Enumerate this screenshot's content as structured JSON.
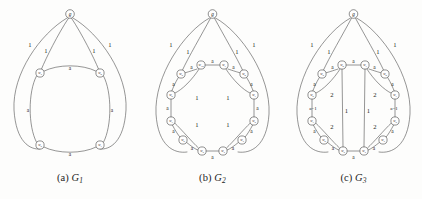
{
  "figure": {
    "background_color": "#fdfdfc",
    "stroke_color": "#555555",
    "text_color": "#1d1d1d"
  },
  "panels": [
    {
      "id": "a",
      "caption_prefix": "(a)",
      "caption_name": "G",
      "caption_sub": "1",
      "apex_label": "g",
      "apex_weights": [
        "1",
        "1",
        "1",
        "1"
      ],
      "cycle_nodes": [
        "w3",
        "w0",
        "w1",
        "w2"
      ],
      "cycle_weights": [
        "a",
        "a",
        "a",
        "a"
      ]
    },
    {
      "id": "b",
      "caption_prefix": "(b)",
      "caption_name": "G",
      "caption_sub": "2",
      "apex_label": "g",
      "apex_weights": [
        "1",
        "1",
        "1",
        "1"
      ],
      "cycle_nodes": [
        "w10",
        "w1",
        "w9",
        "w1b",
        "w2",
        "w3",
        "w4",
        "w5",
        "w6",
        "w7",
        "w8",
        "w9b"
      ],
      "cycle_weights": [
        "a",
        "a",
        "a",
        "a",
        "a",
        "a",
        "a",
        "a",
        "a",
        "a",
        "a",
        "a"
      ],
      "chord_weights": [
        "1",
        "1",
        "1",
        "1"
      ]
    },
    {
      "id": "c",
      "caption_prefix": "(c)",
      "caption_name": "G",
      "caption_sub": "3",
      "apex_label": "g",
      "apex_weights": [
        "1",
        "1",
        "1",
        "1"
      ],
      "cycle_weights": [
        "a",
        "a",
        "a",
        "a",
        "a",
        "a",
        "a",
        "a"
      ],
      "chord_weights": [
        "2",
        "2",
        "2",
        "2"
      ],
      "vertical_weights": [
        "1",
        "1"
      ],
      "long_weights": [
        "a−1",
        "a−1"
      ]
    }
  ],
  "graph_a": {
    "nodes": [
      {
        "name": "g",
        "base": "g",
        "sub": "",
        "x": 70.0,
        "y": 14.0,
        "r": 4.3
      },
      {
        "name": "w3",
        "base": "w",
        "sub": "3",
        "x": 40.0,
        "y": 73.0,
        "r": 4.1
      },
      {
        "name": "w0",
        "base": "w",
        "sub": "0",
        "x": 100.0,
        "y": 73.0,
        "r": 4.1
      },
      {
        "name": "w2",
        "base": "w",
        "sub": "2",
        "x": 40.0,
        "y": 145.0,
        "r": 4.1
      },
      {
        "name": "w1",
        "base": "w",
        "sub": "1",
        "x": 100.0,
        "y": 145.0,
        "r": 4.1
      }
    ],
    "weight_labels": [
      {
        "text": "1",
        "x": 30.0,
        "y": 44.0
      },
      {
        "text": "1",
        "x": 46.0,
        "y": 50.0
      },
      {
        "text": "1",
        "x": 94.0,
        "y": 50.0
      },
      {
        "text": "1",
        "x": 110.0,
        "y": 44.0
      },
      {
        "text": "a",
        "x": 70.0,
        "y": 68.0
      },
      {
        "text": "a",
        "x": 28.0,
        "y": 110.0
      },
      {
        "text": "a",
        "x": 112.0,
        "y": 110.0
      },
      {
        "text": "a",
        "x": 70.0,
        "y": 154.0
      }
    ]
  },
  "graph_b": {
    "nodes": [
      {
        "name": "g",
        "base": "g",
        "sub": "",
        "x": 72.5,
        "y": 14.0,
        "r": 4.3
      },
      {
        "name": "w10",
        "base": "w",
        "sub": "10",
        "x": 61.0,
        "y": 65.0,
        "r": 4.1
      },
      {
        "name": "w1",
        "base": "w",
        "sub": "1",
        "x": 84.0,
        "y": 65.0,
        "r": 4.1
      },
      {
        "name": "w9",
        "base": "w",
        "sub": "9",
        "x": 41.0,
        "y": 74.0,
        "r": 4.1
      },
      {
        "name": "w9r",
        "base": "w",
        "sub": "0",
        "x": 104.0,
        "y": 74.0,
        "r": 4.1
      },
      {
        "name": "w8",
        "base": "w",
        "sub": "8",
        "x": 31.0,
        "y": 95.0,
        "r": 4.1
      },
      {
        "name": "w1r",
        "base": "w",
        "sub": "1",
        "x": 114.0,
        "y": 95.0,
        "r": 4.1
      },
      {
        "name": "w7",
        "base": "w",
        "sub": "7",
        "x": 31.0,
        "y": 121.0,
        "r": 4.1
      },
      {
        "name": "w2r",
        "base": "w",
        "sub": "2",
        "x": 114.0,
        "y": 121.0,
        "r": 4.1
      },
      {
        "name": "w6",
        "base": "w",
        "sub": "6",
        "x": 43.0,
        "y": 140.0,
        "r": 4.1
      },
      {
        "name": "w3r",
        "base": "w",
        "sub": "3",
        "x": 102.0,
        "y": 140.0,
        "r": 4.1
      },
      {
        "name": "w5",
        "base": "w",
        "sub": "5",
        "x": 62.0,
        "y": 151.0,
        "r": 4.1
      },
      {
        "name": "w4",
        "base": "w",
        "sub": "4",
        "x": 83.0,
        "y": 151.0,
        "r": 4.1
      }
    ],
    "weight_labels": [
      {
        "text": "1",
        "x": 31.0,
        "y": 44.0
      },
      {
        "text": "1",
        "x": 48.0,
        "y": 51.0
      },
      {
        "text": "1",
        "x": 97.0,
        "y": 51.0
      },
      {
        "text": "1",
        "x": 114.0,
        "y": 44.0
      },
      {
        "text": "a",
        "x": 72.5,
        "y": 60.5
      },
      {
        "text": "a",
        "x": 51.5,
        "y": 66.5
      },
      {
        "text": "a",
        "x": 93.5,
        "y": 66.5
      },
      {
        "text": "a",
        "x": 33.5,
        "y": 84.0
      },
      {
        "text": "a",
        "x": 111.5,
        "y": 84.0
      },
      {
        "text": "a",
        "x": 27.5,
        "y": 108.0
      },
      {
        "text": "a",
        "x": 117.5,
        "y": 108.0
      },
      {
        "text": "a",
        "x": 33.5,
        "y": 131.0
      },
      {
        "text": "a",
        "x": 111.5,
        "y": 131.0
      },
      {
        "text": "a",
        "x": 52.0,
        "y": 148.0
      },
      {
        "text": "a",
        "x": 93.0,
        "y": 148.0
      },
      {
        "text": "a",
        "x": 72.5,
        "y": 157.0
      },
      {
        "text": "1",
        "x": 57.0,
        "y": 97.0
      },
      {
        "text": "1",
        "x": 88.0,
        "y": 97.0
      },
      {
        "text": "1",
        "x": 57.0,
        "y": 124.0
      },
      {
        "text": "1",
        "x": 88.0,
        "y": 124.0
      }
    ]
  },
  "graph_c": {
    "nodes": [
      {
        "name": "g",
        "base": "g",
        "sub": "",
        "x": 68.5,
        "y": 14.0,
        "r": 4.3
      },
      {
        "name": "w10",
        "base": "w",
        "sub": "0",
        "x": 57.0,
        "y": 65.0,
        "r": 4.1
      },
      {
        "name": "w1",
        "base": "w",
        "sub": "1",
        "x": 80.0,
        "y": 65.0,
        "r": 4.1
      },
      {
        "name": "w9",
        "base": "w",
        "sub": "9",
        "x": 37.0,
        "y": 74.0,
        "r": 4.1
      },
      {
        "name": "w0r",
        "base": "w",
        "sub": "0",
        "x": 100.0,
        "y": 74.0,
        "r": 4.1
      },
      {
        "name": "w8",
        "base": "w",
        "sub": "8",
        "x": 27.0,
        "y": 95.0,
        "r": 4.1
      },
      {
        "name": "w1r",
        "base": "w",
        "sub": "1",
        "x": 110.0,
        "y": 95.0,
        "r": 4.1
      },
      {
        "name": "w7",
        "base": "w",
        "sub": "7",
        "x": 27.0,
        "y": 121.0,
        "r": 4.1
      },
      {
        "name": "w2r",
        "base": "w",
        "sub": "2",
        "x": 110.0,
        "y": 121.0,
        "r": 4.1
      },
      {
        "name": "w6",
        "base": "w",
        "sub": "6",
        "x": 39.0,
        "y": 140.0,
        "r": 4.1
      },
      {
        "name": "w3r",
        "base": "w",
        "sub": "3",
        "x": 98.0,
        "y": 140.0,
        "r": 4.1
      },
      {
        "name": "w5",
        "base": "w",
        "sub": "5",
        "x": 58.0,
        "y": 151.0,
        "r": 4.1
      },
      {
        "name": "w4",
        "base": "w",
        "sub": "4",
        "x": 79.0,
        "y": 151.0,
        "r": 4.1
      }
    ],
    "weight_labels": [
      {
        "text": "1",
        "x": 27.0,
        "y": 44.0
      },
      {
        "text": "1",
        "x": 44.0,
        "y": 51.0
      },
      {
        "text": "1",
        "x": 93.0,
        "y": 51.0
      },
      {
        "text": "1",
        "x": 110.0,
        "y": 44.0
      },
      {
        "text": "a",
        "x": 68.5,
        "y": 60.5
      },
      {
        "text": "a",
        "x": 47.5,
        "y": 66.5
      },
      {
        "text": "a",
        "x": 89.5,
        "y": 66.5
      },
      {
        "text": "a",
        "x": 29.5,
        "y": 84.0
      },
      {
        "text": "a",
        "x": 107.5,
        "y": 84.0
      },
      {
        "text": "a",
        "x": 29.5,
        "y": 131.0
      },
      {
        "text": "a",
        "x": 107.5,
        "y": 131.0
      },
      {
        "text": "a",
        "x": 48.0,
        "y": 148.0
      },
      {
        "text": "a",
        "x": 89.0,
        "y": 148.0
      },
      {
        "text": "a",
        "x": 68.5,
        "y": 157.0
      },
      {
        "text": "2",
        "x": 47.0,
        "y": 94.0
      },
      {
        "text": "2",
        "x": 90.0,
        "y": 94.0
      },
      {
        "text": "2",
        "x": 47.0,
        "y": 126.0
      },
      {
        "text": "2",
        "x": 90.0,
        "y": 126.0
      },
      {
        "text": "1",
        "x": 61.5,
        "y": 110.0
      },
      {
        "text": "1",
        "x": 83.5,
        "y": 110.0
      },
      {
        "text": "a−1",
        "x": 28.0,
        "y": 108.0
      },
      {
        "text": "a−1",
        "x": 109.0,
        "y": 108.0
      }
    ]
  }
}
